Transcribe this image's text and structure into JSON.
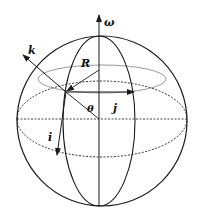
{
  "diagram": {
    "labels": {
      "omega": "ω",
      "k": "k",
      "R": "R",
      "theta": "θ",
      "j": "j",
      "i": "i"
    },
    "colors": {
      "line": "#1a1a1a",
      "secondary": "#9a9a9a",
      "background": "#ffffff"
    }
  }
}
